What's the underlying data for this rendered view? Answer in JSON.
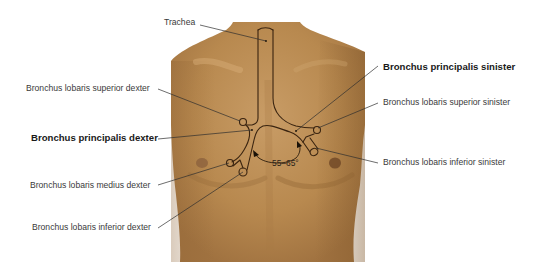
{
  "figure": {
    "colors": {
      "background": "#ffffff",
      "skin_light": "#c79a63",
      "skin_mid": "#b3864f",
      "skin_dark": "#9a6f3d",
      "outline": "#3a2410",
      "leader": "#2e2e2e",
      "label_text": "#3a3a3a"
    }
  },
  "labels": {
    "trachea": "Trachea",
    "bronchus_lobaris_superior_dexter": "Bronchus lobaris superior dexter",
    "bronchus_principalis_dexter": "Bronchus principalis dexter",
    "bronchus_lobaris_medius_dexter": "Bronchus lobaris medius dexter",
    "bronchus_lobaris_inferior_dexter": "Bronchus lobaris inferior dexter",
    "bronchus_principalis_sinister": "Bronchus principalis sinister",
    "bronchus_lobaris_superior_sinister": "Bronchus lobaris superior sinister",
    "bronchus_lobaris_inferior_sinister": "Bronchus lobaris inferior sinister"
  },
  "angle": {
    "label": "55–65°"
  }
}
